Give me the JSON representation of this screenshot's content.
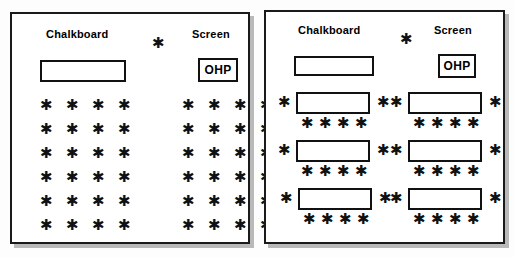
{
  "figure": {
    "background_color": "#fdfdfd",
    "ink_color": "#111111",
    "panel_border_color": "#1a1a1a",
    "seat_glyph": "*",
    "seat_glyph_name": "asterisk-seat-icon"
  },
  "panels": [
    {
      "id": "left",
      "name": "row-seating-layout",
      "labels": {
        "chalkboard": "Chalkboard",
        "screen": "Screen",
        "ohp": "OHP"
      },
      "front_elements": {
        "chalkboard_rect": {
          "x": 28,
          "y": 46,
          "w": 86,
          "h": 22
        },
        "ohp_box": {
          "x": 186,
          "y": 44,
          "w": 40,
          "h": 24
        },
        "center_seat": {
          "x": 140,
          "y": 24
        }
      },
      "seat_grid": {
        "rows": 6,
        "columns_per_cluster": 4,
        "clusters": 2,
        "total_seats": 48,
        "row_spacing": 24,
        "column_spacing": 26,
        "cluster_gap": 38,
        "origin": {
          "x": 28,
          "y": 86
        }
      },
      "tables": []
    },
    {
      "id": "right",
      "name": "table-cluster-seating-layout",
      "labels": {
        "chalkboard": "Chalkboard",
        "screen": "Screen",
        "ohp": "OHP"
      },
      "front_elements": {
        "chalkboard_rect": {
          "x": 28,
          "y": 44,
          "w": 80,
          "h": 20
        },
        "ohp_box": {
          "x": 172,
          "y": 42,
          "w": 38,
          "h": 24
        },
        "center_seat": {
          "x": 134,
          "y": 22
        }
      },
      "seat_grid": null,
      "tables": [
        {
          "row": 1,
          "column": 1,
          "x": 30,
          "y": 80,
          "w": 74,
          "h": 22,
          "seats_left": 1,
          "seats_right": 1,
          "seats_below": 4
        },
        {
          "row": 1,
          "column": 2,
          "x": 142,
          "y": 80,
          "w": 74,
          "h": 22,
          "seats_left": 1,
          "seats_right": 1,
          "seats_below": 4
        },
        {
          "row": 2,
          "column": 1,
          "x": 30,
          "y": 128,
          "w": 74,
          "h": 22,
          "seats_left": 1,
          "seats_right": 1,
          "seats_below": 4
        },
        {
          "row": 2,
          "column": 2,
          "x": 142,
          "y": 128,
          "w": 74,
          "h": 22,
          "seats_left": 1,
          "seats_right": 1,
          "seats_below": 4
        },
        {
          "row": 3,
          "column": 1,
          "x": 32,
          "y": 176,
          "w": 74,
          "h": 22,
          "seats_left": 1,
          "seats_right": 1,
          "seats_below": 4
        },
        {
          "row": 3,
          "column": 2,
          "x": 142,
          "y": 176,
          "w": 74,
          "h": 22,
          "seats_left": 1,
          "seats_right": 1,
          "seats_below": 4
        }
      ],
      "table_count": 6,
      "seats_per_table": 6,
      "total_seats": 36
    }
  ]
}
